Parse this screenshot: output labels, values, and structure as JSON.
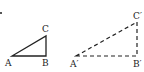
{
  "diagram": {
    "type": "geometry-similar-triangles",
    "colors": {
      "stroke": "#222222",
      "background": "#ffffff"
    },
    "triangles": [
      {
        "name": "ABC",
        "style": "solid",
        "vertices": {
          "A": {
            "label": "A",
            "x": 12,
            "y": 56
          },
          "B": {
            "label": "B",
            "x": 46,
            "y": 56
          },
          "C": {
            "label": "C",
            "x": 46,
            "y": 36
          }
        },
        "right_angle_at": "B"
      },
      {
        "name": "A'B'C'",
        "style": "dashed",
        "vertices": {
          "A": {
            "label": "A'",
            "x": 76,
            "y": 56
          },
          "B": {
            "label": "B'",
            "x": 137,
            "y": 56
          },
          "C": {
            "label": "C'",
            "x": 137,
            "y": 22
          }
        },
        "right_angle_at": "B'"
      }
    ]
  },
  "labels": {
    "A": "A",
    "B": "B",
    "C": "C",
    "A_prime": "A′",
    "B_prime": "B′",
    "C_prime": "C′"
  }
}
